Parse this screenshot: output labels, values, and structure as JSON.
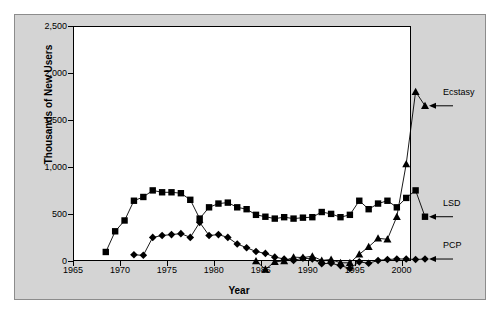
{
  "chart_data": {
    "type": "line",
    "title": "",
    "xlabel": "Year",
    "ylabel": "Thousands of New Users",
    "xlim": [
      1965,
      2001
    ],
    "ylim": [
      0,
      2500
    ],
    "xticks": [
      1965,
      1970,
      1975,
      1980,
      1985,
      1990,
      1995,
      2000
    ],
    "yticks": [
      0,
      500,
      1000,
      1500,
      2000,
      2500
    ],
    "xtick_labels": [
      "1965",
      "1970",
      "1975",
      "1980",
      "1985",
      "1990",
      "1995",
      "2000"
    ],
    "ytick_labels": [
      "0",
      "500",
      "1,000",
      "1,500",
      "2,000",
      "2,500"
    ],
    "grid": false,
    "legend_position": "right-callouts",
    "series": [
      {
        "name": "Ecstasy",
        "marker": "triangle",
        "color": "#000000",
        "x": [
          1983,
          1984,
          1985,
          1986,
          1987,
          1988,
          1989,
          1990,
          1991,
          1992,
          1993,
          1994,
          1995,
          1996,
          1997,
          1998,
          1999,
          2000,
          2001
        ],
        "values": [
          150,
          60,
          140,
          150,
          190,
          185,
          200,
          155,
          165,
          130,
          130,
          220,
          300,
          390,
          380,
          620,
          1180,
          1950,
          1800
        ]
      },
      {
        "name": "LSD",
        "marker": "square",
        "color": "#000000",
        "x": [
          1967,
          1968,
          1969,
          1970,
          1971,
          1972,
          1973,
          1974,
          1975,
          1976,
          1977,
          1978,
          1979,
          1980,
          1981,
          1982,
          1983,
          1984,
          1985,
          1986,
          1987,
          1988,
          1989,
          1990,
          1991,
          1992,
          1993,
          1994,
          1995,
          1996,
          1997,
          1998,
          1999,
          2000,
          2001
        ],
        "values": [
          245,
          465,
          580,
          790,
          830,
          900,
          880,
          880,
          870,
          800,
          600,
          720,
          760,
          770,
          720,
          700,
          640,
          620,
          600,
          615,
          600,
          610,
          615,
          670,
          650,
          615,
          640,
          790,
          700,
          760,
          790,
          720,
          820,
          900,
          620
        ]
      },
      {
        "name": "PCP",
        "marker": "diamond",
        "color": "#000000",
        "x": [
          1970,
          1971,
          1972,
          1973,
          1974,
          1975,
          1976,
          1977,
          1978,
          1979,
          1980,
          1981,
          1982,
          1983,
          1984,
          1985,
          1986,
          1987,
          1988,
          1989,
          1990,
          1991,
          1992,
          1993,
          1994,
          1995,
          1996,
          1997,
          1998,
          1999,
          2000,
          2001
        ],
        "values": [
          215,
          210,
          400,
          420,
          430,
          440,
          400,
          560,
          420,
          430,
          400,
          330,
          290,
          250,
          230,
          190,
          170,
          155,
          180,
          170,
          120,
          125,
          100,
          70,
          140,
          125,
          155,
          165,
          170,
          170,
          165,
          170
        ]
      }
    ],
    "callouts": [
      {
        "label": "Ecstasy",
        "series": "Ecstasy"
      },
      {
        "label": "LSD",
        "series": "LSD"
      },
      {
        "label": "PCP",
        "series": "PCP"
      }
    ]
  }
}
